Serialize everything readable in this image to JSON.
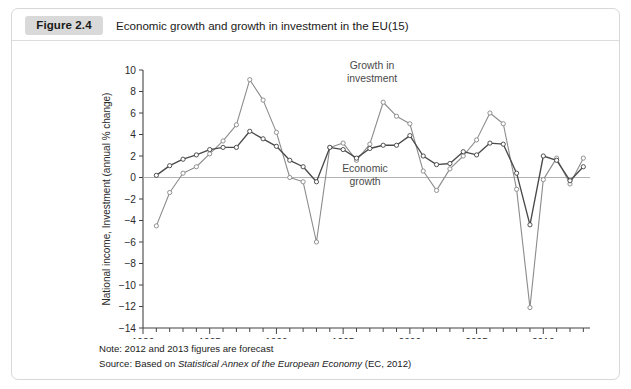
{
  "figure": {
    "badge": "Figure 2.4",
    "title": "Economic growth and growth in investment in the EU(15)"
  },
  "footnotes": {
    "note_label": "Note: 2012 and 2013 figures are forecast",
    "source_prefix": "Source: Based on ",
    "source_italic": "Statistical Annex of the European Economy",
    "source_suffix": " (EC, 2012)"
  },
  "annotations": {
    "investment_line1": "Growth in",
    "investment_line2": "investment",
    "economic_line1": "Economic",
    "economic_line2": "growth"
  },
  "chart_data": {
    "type": "line",
    "title": "Economic growth and growth in investment in the EU(15)",
    "xlabel": "",
    "ylabel": "National income, Investment (annual % change)",
    "xlim": [
      1980,
      2013.5
    ],
    "ylim": [
      -14,
      10
    ],
    "yticks": [
      -14,
      -12,
      -10,
      -8,
      -6,
      -4,
      -2,
      0,
      2,
      4,
      6,
      8,
      10
    ],
    "xticks": [
      1980,
      1985,
      1990,
      1995,
      2000,
      2005,
      2010
    ],
    "xtick_labels": [
      "1980",
      "1985",
      "1990",
      "1995",
      "2000",
      "2005",
      "2010"
    ],
    "ytick_labels": [
      "-14",
      "-12",
      "-10",
      "-8",
      "-6",
      "-4",
      "-2",
      "0",
      "2",
      "4",
      "6",
      "8",
      "10"
    ],
    "x_minor_tick_interval": 1,
    "grid": false,
    "zero_line": true,
    "legend": "annotations",
    "marker": "open-circle",
    "x": [
      1981,
      1982,
      1983,
      1984,
      1985,
      1986,
      1987,
      1988,
      1989,
      1990,
      1991,
      1992,
      1993,
      1994,
      1995,
      1996,
      1997,
      1998,
      1999,
      2000,
      2001,
      2002,
      2003,
      2004,
      2005,
      2006,
      2007,
      2008,
      2009,
      2010,
      2011,
      2012,
      2013
    ],
    "series": [
      {
        "name": "Growth in investment",
        "color": "#8c8c8c",
        "values": [
          -4.5,
          -1.4,
          0.4,
          1.0,
          2.2,
          3.4,
          4.9,
          9.1,
          7.2,
          4.2,
          0.0,
          -0.4,
          -6.0,
          2.8,
          3.2,
          1.6,
          3.1,
          7.0,
          5.7,
          5.0,
          0.6,
          -1.2,
          0.8,
          2.0,
          3.5,
          6.0,
          5.0,
          -1.1,
          -12.1,
          -0.2,
          1.8,
          -0.6,
          1.8
        ]
      },
      {
        "name": "Economic growth",
        "color": "#4a4a4a",
        "values": [
          0.2,
          1.1,
          1.7,
          2.1,
          2.6,
          2.8,
          2.8,
          4.3,
          3.6,
          2.9,
          1.6,
          1.0,
          -0.4,
          2.8,
          2.6,
          1.8,
          2.7,
          3.0,
          3.0,
          3.9,
          2.0,
          1.2,
          1.3,
          2.4,
          2.1,
          3.2,
          3.1,
          0.4,
          -4.4,
          2.0,
          1.6,
          -0.3,
          1.0
        ]
      }
    ]
  }
}
